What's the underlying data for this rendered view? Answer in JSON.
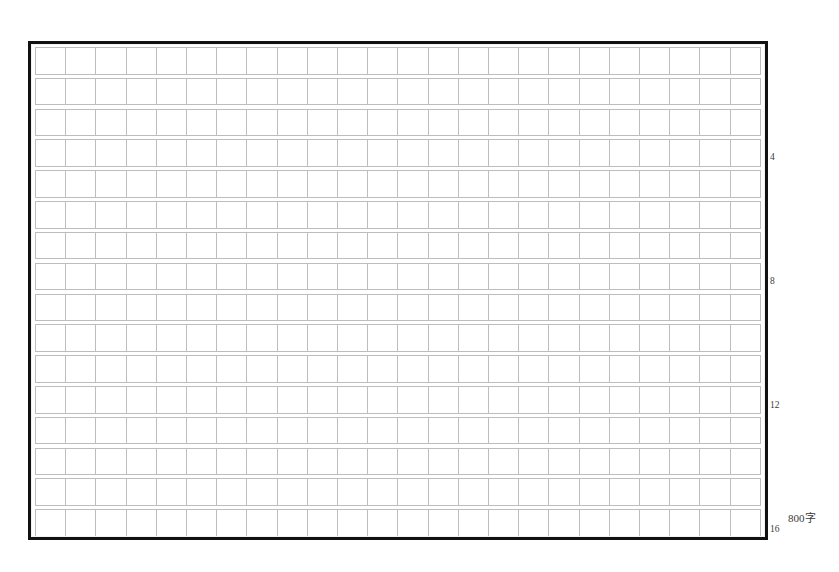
{
  "sheet": {
    "kind": "manuscript-paper",
    "title": "",
    "background_color": "#ffffff",
    "frame_color": "#111111",
    "grid_line_color": "#bdbdbd",
    "text_color": "#3b3b3b"
  },
  "grid": {
    "rows": 16,
    "columns": 24,
    "cell_width_px": 30.2,
    "cell_height_px": 27.6,
    "row_gap_px": 3,
    "frame": {
      "x": 28,
      "y": 41,
      "width": 740,
      "height": 499
    },
    "total_cells": 384
  },
  "row_numbers": [
    {
      "label": "4",
      "row": 4,
      "top_px": 112
    },
    {
      "label": "8",
      "row": 8,
      "top_px": 236
    },
    {
      "label": "12",
      "row": 12,
      "top_px": 360
    },
    {
      "label": "16",
      "row": 16,
      "top_px": 484
    }
  ],
  "capacity_note": {
    "label": "800字"
  }
}
